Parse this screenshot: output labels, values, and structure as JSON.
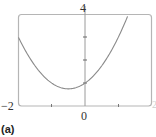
{
  "chart_data": {
    "type": "line",
    "title": "",
    "panel_label": "(a)",
    "xlabel": "",
    "ylabel": "",
    "xlim": [
      -2,
      2
    ],
    "ylim": [
      0,
      4
    ],
    "x_ticks": [
      -1,
      0,
      1
    ],
    "y_ticks": [
      1,
      2,
      3
    ],
    "visible_tick_labels": {
      "x_min": "−2",
      "x_zero": "0",
      "x_max": "2",
      "y_max": "4"
    },
    "grid": false,
    "legend": null,
    "series": [
      {
        "name": "y = x² + x + 1",
        "x": [
          -2,
          -1.5,
          -1,
          -0.5,
          0,
          0.5,
          1,
          1.3
        ],
        "y": [
          3,
          1.75,
          1,
          0.75,
          1,
          1.75,
          3,
          3.99
        ]
      }
    ],
    "colors": {
      "curve": "#8a8a8a",
      "frame": "#b5b5b5",
      "axis": "#9a9a9a"
    }
  }
}
